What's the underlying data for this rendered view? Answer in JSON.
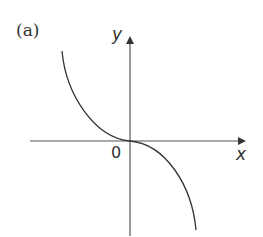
{
  "figure": {
    "part_label": "(a)",
    "x_axis_label": "x",
    "y_axis_label": "y",
    "origin_label": "0",
    "curve_description": "decreasing cubic through origin, flat at origin (y = -x^3 shape)",
    "colors": {
      "axis": "#555555",
      "curve": "#333333",
      "text": "#333333"
    }
  }
}
